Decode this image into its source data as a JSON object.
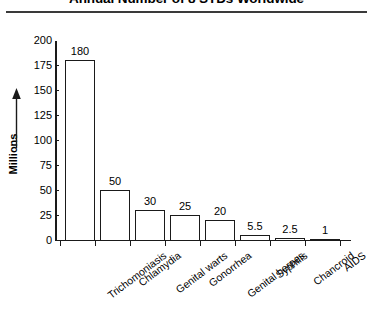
{
  "chart_data": {
    "type": "bar",
    "title": "Annual Number of 8 STDs Worldwide",
    "xlabel": "",
    "ylabel": "Millions",
    "ylim": [
      0,
      200
    ],
    "yticks": [
      200,
      175,
      150,
      125,
      100,
      75,
      50,
      25,
      0
    ],
    "grid": false,
    "legend": null,
    "categories": [
      "Trichomoniasis",
      "Chlamydia",
      "Genital warts",
      "Gonorrhea",
      "Genital herpes",
      "Syphilis",
      "Chancroid",
      "AIDS"
    ],
    "values": [
      180,
      50,
      30,
      25,
      20,
      5.5,
      2.5,
      1
    ],
    "value_labels": [
      "180",
      "50",
      "30",
      "25",
      "20",
      "5.5",
      "2.5",
      "1"
    ],
    "bar_fill_color": "#ffffff",
    "bar_edge_color": "#1a1a1a",
    "axis_color": "#1a1a1a",
    "text_color": "#000000"
  },
  "axis": {
    "y_tick_labels": [
      "200",
      "175",
      "150",
      "125",
      "100",
      "75",
      "50",
      "25",
      "0"
    ],
    "y_axis_title": "Millions",
    "arrow_icon": "up-arrow-icon"
  }
}
